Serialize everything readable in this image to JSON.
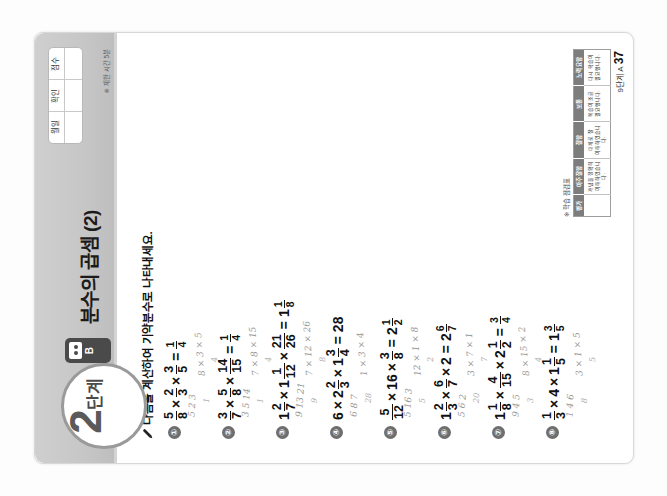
{
  "worksheet": {
    "step_number": "2",
    "step_unit": "단계",
    "set_label": "B",
    "title": "분수의 곱셈 (2)",
    "instruction": "다음을 계산하여 기약분수로 나타내세요.",
    "pencil_icon": "pencil-icon",
    "meta_table": {
      "headers": [
        "월일",
        "확인",
        "점수"
      ],
      "values": [
        "",
        "",
        ""
      ]
    },
    "meta_note": "※ 제한 시간 5분",
    "footer": {
      "label": "9단계 A",
      "page": "37"
    }
  },
  "problems": [
    {
      "no": "①",
      "terms": [
        {
          "type": "fraction",
          "num": "5",
          "den": "8"
        },
        {
          "type": "op",
          "text": "×"
        },
        {
          "type": "fraction",
          "num": "2",
          "den": "3"
        },
        {
          "type": "op",
          "text": "×"
        },
        {
          "type": "fraction",
          "num": "3",
          "den": "5"
        }
      ],
      "answer": {
        "type": "fraction",
        "num": "1",
        "den": "4"
      },
      "work": [
        "5 2 3",
        "8 × 3 × 5",
        "1",
        "4"
      ]
    },
    {
      "no": "②",
      "terms": [
        {
          "type": "fraction",
          "num": "3",
          "den": "7"
        },
        {
          "type": "op",
          "text": "×"
        },
        {
          "type": "fraction",
          "num": "5",
          "den": "8"
        },
        {
          "type": "op",
          "text": "×"
        },
        {
          "type": "fraction",
          "num": "14",
          "den": "15"
        }
      ],
      "answer": {
        "type": "fraction",
        "num": "1",
        "den": "4"
      },
      "work": [
        "3 5 14",
        "7 × 8 × 15",
        "1",
        "4"
      ]
    },
    {
      "no": "③",
      "terms": [
        {
          "type": "mixed",
          "whole": "1",
          "num": "2",
          "den": "7"
        },
        {
          "type": "op",
          "text": "×"
        },
        {
          "type": "mixed",
          "whole": "1",
          "num": "1",
          "den": "12"
        },
        {
          "type": "op",
          "text": "×"
        },
        {
          "type": "fraction",
          "num": "21",
          "den": "26"
        }
      ],
      "answer": {
        "type": "mixed",
        "whole": "1",
        "num": "1",
        "den": "8"
      },
      "work": [
        "9 13 21",
        "7 × 12 × 26",
        "9",
        "8"
      ]
    },
    {
      "no": "④",
      "terms": [
        {
          "type": "int",
          "text": "6"
        },
        {
          "type": "op",
          "text": "×"
        },
        {
          "type": "mixed",
          "whole": "2",
          "num": "2",
          "den": "3"
        },
        {
          "type": "op",
          "text": "×"
        },
        {
          "type": "mixed",
          "whole": "1",
          "num": "3",
          "den": "4"
        }
      ],
      "answer": {
        "type": "int",
        "text": "28"
      },
      "work": [
        "6 8 7",
        "1 × 3 × 4",
        "28"
      ]
    },
    {
      "no": "⑤",
      "terms": [
        {
          "type": "fraction",
          "num": "5",
          "den": "12"
        },
        {
          "type": "op",
          "text": "×"
        },
        {
          "type": "int",
          "text": "16"
        },
        {
          "type": "op",
          "text": "×"
        },
        {
          "type": "fraction",
          "num": "3",
          "den": "8"
        }
      ],
      "answer": {
        "type": "mixed",
        "whole": "2",
        "num": "1",
        "den": "2"
      },
      "work": [
        "5 16 3",
        "12 × 1 × 8",
        "5",
        "2"
      ]
    },
    {
      "no": "⑥",
      "terms": [
        {
          "type": "mixed",
          "whole": "1",
          "num": "2",
          "den": "3"
        },
        {
          "type": "op",
          "text": "×"
        },
        {
          "type": "fraction",
          "num": "6",
          "den": "7"
        },
        {
          "type": "op",
          "text": "×"
        },
        {
          "type": "int",
          "text": "2"
        }
      ],
      "answer": {
        "type": "mixed",
        "whole": "2",
        "num": "6",
        "den": "7"
      },
      "work": [
        "5 6 2",
        "3 × 7 × 1",
        "20",
        "7"
      ]
    },
    {
      "no": "⑦",
      "terms": [
        {
          "type": "mixed",
          "whole": "1",
          "num": "1",
          "den": "8"
        },
        {
          "type": "op",
          "text": "×"
        },
        {
          "type": "fraction",
          "num": "4",
          "den": "15"
        },
        {
          "type": "op",
          "text": "×"
        },
        {
          "type": "mixed",
          "whole": "2",
          "num": "1",
          "den": "2"
        }
      ],
      "answer": {
        "type": "fraction",
        "num": "3",
        "den": "4"
      },
      "work": [
        "9 4 5",
        "8 × 15 × 2",
        "3",
        "4"
      ]
    },
    {
      "no": "⑧",
      "terms": [
        {
          "type": "fraction",
          "num": "1",
          "den": "3"
        },
        {
          "type": "op",
          "text": "×"
        },
        {
          "type": "int",
          "text": "4"
        },
        {
          "type": "op",
          "text": "×"
        },
        {
          "type": "mixed",
          "whole": "1",
          "num": "1",
          "den": "5"
        }
      ],
      "answer": {
        "type": "mixed",
        "whole": "1",
        "num": "3",
        "den": "5"
      },
      "work": [
        "1 4 6",
        "3 × 1 × 5",
        "8",
        "5"
      ]
    }
  ],
  "eval_table": {
    "title": "※ 학습 점검표",
    "headers": [
      "평가",
      "아주 잘함",
      "잘함",
      "보통",
      "노력 요함"
    ],
    "rows": [
      [
        "",
        "개념을 정확히\n이해하였습니다.",
        "대체로 잘\n이해하였습니다.",
        "복습이 조금\n필요합니다.",
        "다시 학습이\n필요합니다."
      ]
    ]
  }
}
